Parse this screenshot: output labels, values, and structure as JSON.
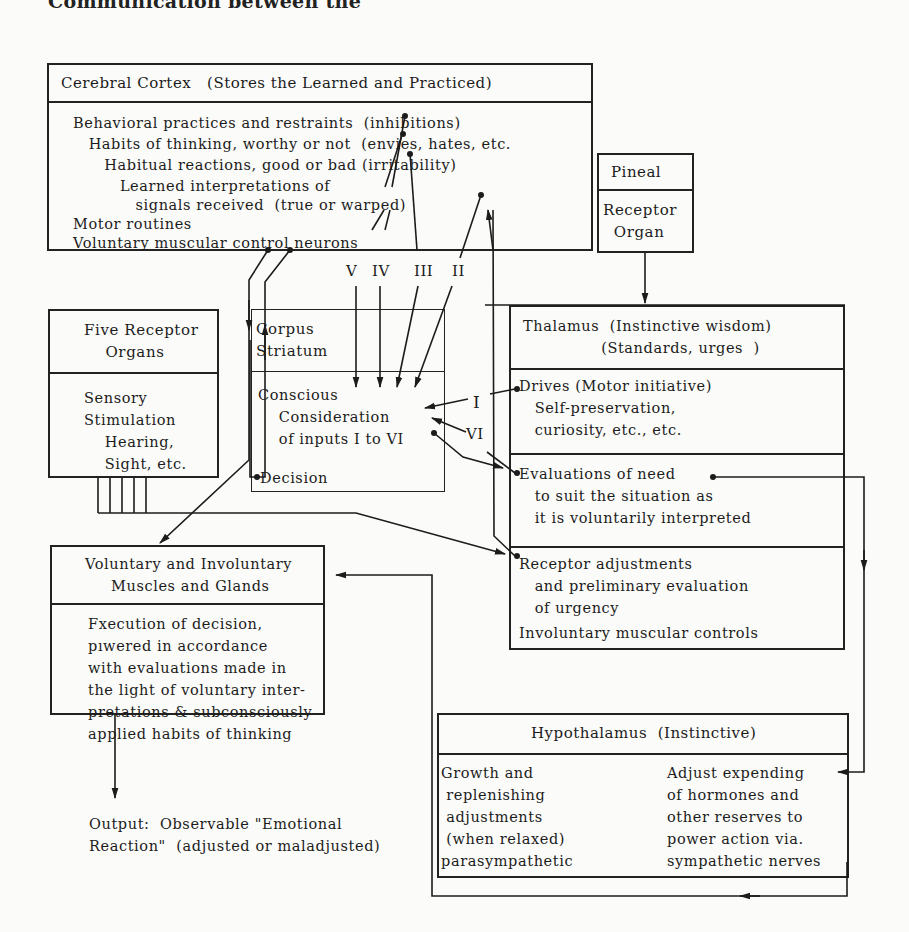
{
  "heading": "Communication between the",
  "cortex": {
    "title": "Cerebral Cortex   (Stores the Learned and Practiced)",
    "lines": [
      "Behavioral practices and restraints  (inhibitions)",
      "   Habits of thinking, worthy or not  (envies, hates, etc.",
      "      Habitual reactions, good or bad (irritability)",
      "         Learned interpretations of",
      "            signals received  (true or warped)",
      "Motor routines",
      "Voluntary muscular control neurons"
    ]
  },
  "pineal": {
    "title": "Pineal",
    "body": "Receptor\n  Organ"
  },
  "inputs": [
    "V",
    "IV",
    "III",
    "II",
    "I",
    "VI"
  ],
  "five_receptor": {
    "title": "Five Receptor\n    Organs",
    "body": "Sensory\nStimulation\n    Hearing,\n    Sight, etc."
  },
  "corpus": {
    "title": "Corpus\nStriatum",
    "body": "Conscious\n    Consideration\n    of inputs I to VI",
    "decision": "Decision"
  },
  "thalamus": {
    "title": "Thalamus  (Instinctive wisdom)\n               (Standards, urges  )",
    "drives": "Drives (Motor initiative)\n   Self-preservation,\n   curiosity, etc., etc.",
    "evaluations": "Evaluations of need\n   to suit the situation as\n   it is voluntarily interpreted",
    "receptor": "Receptor adjustments\n   and preliminary evaluation\n   of urgency",
    "involuntary": "Involuntary muscular controls"
  },
  "muscles": {
    "title": "Voluntary and Involuntary\n     Muscles and Glands",
    "body": "Fxecution of decision,\npıwered in accordance\nwith evaluations made in\nthe light of voluntary inter-\npretations & subconsciously\napplied habits of thinking"
  },
  "output": "Output:  Observable \"Emotional\nReaction\"  (adjusted or maladjusted)",
  "hypothalamus": {
    "title": "Hypothalamus  (Instinctive)",
    "left": "Growth and\n replenishing\n adjustments\n (when relaxed)\nparasympathetic",
    "right": "Adjust expending\nof hormones and\nother reserves to\npower action via.\nsympathetic nerves"
  }
}
